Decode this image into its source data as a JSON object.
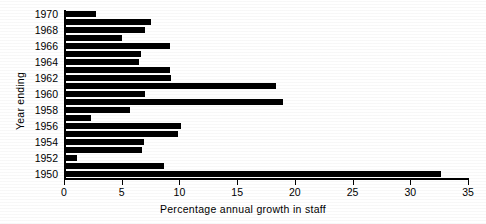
{
  "chart_data": {
    "type": "bar",
    "orientation": "horizontal",
    "title": "",
    "xlabel": "Percentage annual growth in staff",
    "ylabel": "Year ending",
    "xlim": [
      0,
      35
    ],
    "xticks": [
      0,
      5,
      10,
      15,
      20,
      25,
      30,
      35
    ],
    "xticklabels": [
      "0",
      "5",
      "10",
      "15",
      "20",
      "25",
      "30",
      "35"
    ],
    "grid": false,
    "legend": null,
    "categories": [
      "1970",
      "1969",
      "1968",
      "1967",
      "1966",
      "1965",
      "1964",
      "1963",
      "1962",
      "1961",
      "1960",
      "1959",
      "1958",
      "1957",
      "1956",
      "1955",
      "1954",
      "1953",
      "1952",
      "1951",
      "1950"
    ],
    "yticklabels": [
      "1970",
      "1968",
      "1966",
      "1964",
      "1962",
      "1960",
      "1958",
      "1956",
      "1954",
      "1952",
      "1950"
    ],
    "values": [
      2.8,
      7.5,
      7.0,
      5.0,
      9.2,
      6.7,
      6.5,
      9.2,
      9.3,
      18.4,
      7.0,
      19.0,
      5.7,
      2.3,
      10.1,
      9.9,
      6.9,
      6.8,
      1.1,
      8.7,
      32.7
    ],
    "bar_color": "#000000",
    "background_color": "#ffffff"
  },
  "axes": {
    "y_title": "Year ending",
    "x_title": "Percentage annual growth in staff"
  }
}
